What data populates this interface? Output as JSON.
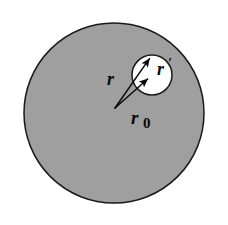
{
  "figure": {
    "background_color": "#ffffff",
    "width": 228,
    "height": 225,
    "shapes": {
      "outer_circle": {
        "name": "shaded-sphere",
        "center_x": 114,
        "center_y": 113,
        "radius": 90,
        "fill_color": "#b9b9b9",
        "stroke_color": "#1a1a1a",
        "stroke_width": 1.4,
        "texture": "speckled-grey"
      },
      "inner_circle": {
        "name": "cavity",
        "center_x": 152,
        "center_y": 75,
        "radius": 20,
        "fill_color": "#ffffff",
        "stroke_color": "#1a1a1a",
        "stroke_width": 1.4
      }
    },
    "vectors": [
      {
        "name": "vector-r",
        "label": "r",
        "tail_x": 115,
        "tail_y": 108,
        "tip_x": 152,
        "tip_y": 55,
        "stroke_color": "#0a0a0a"
      },
      {
        "name": "vector-r0",
        "label": "r0",
        "tail_x": 115,
        "tail_y": 108,
        "tip_x": 151,
        "tip_y": 76,
        "stroke_color": "#0a0a0a"
      }
    ],
    "labels": [
      {
        "name": "label-r",
        "text": "r",
        "prime": "",
        "subscript": "",
        "x": 107,
        "y": 85,
        "font_size": 18
      },
      {
        "name": "label-r-prime",
        "text": "r",
        "prime": "′",
        "subscript": "",
        "x": 157,
        "y": 75,
        "font_size": 18
      },
      {
        "name": "label-r-zero",
        "text": "r",
        "prime": "",
        "subscript": "0",
        "x": 131,
        "y": 124,
        "font_size": 18
      }
    ]
  }
}
